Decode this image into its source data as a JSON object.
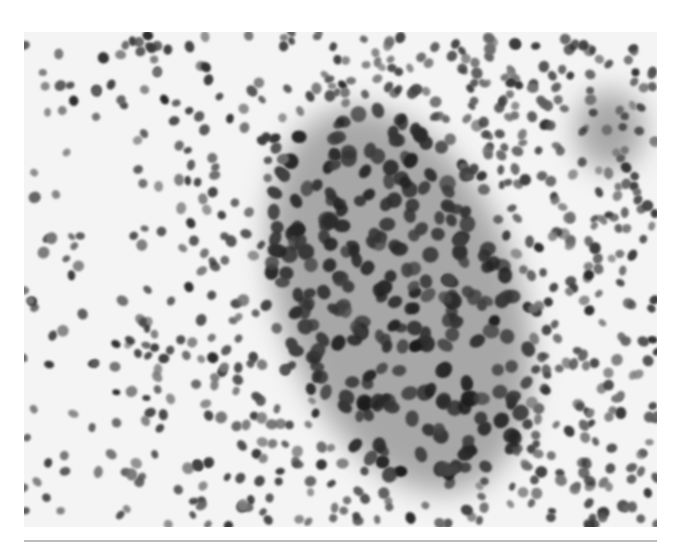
{
  "figure": {
    "type": "grayscale cytology micrograph",
    "content": "dense field of dark-stained cell nuclei with a central cohesive sheet of larger cells on gray cytoplasm",
    "colors": {
      "background": "#f4f4f4",
      "cytoplasm_sheet": "#8e8e8e",
      "nucleus_dark": "#2a2a2a",
      "nucleus_light": "#7a7a7a",
      "rule": "#bdbdbd"
    },
    "regions": [
      {
        "name": "central-sheet",
        "cx": 400,
        "cy": 300,
        "rx": 120,
        "ry": 200,
        "rotate": -20
      },
      {
        "name": "right-cluster",
        "cx": 610,
        "cy": 130,
        "rx": 35,
        "ry": 40,
        "rotate": 0
      }
    ],
    "nuclei_count": 900,
    "seed": 7
  }
}
